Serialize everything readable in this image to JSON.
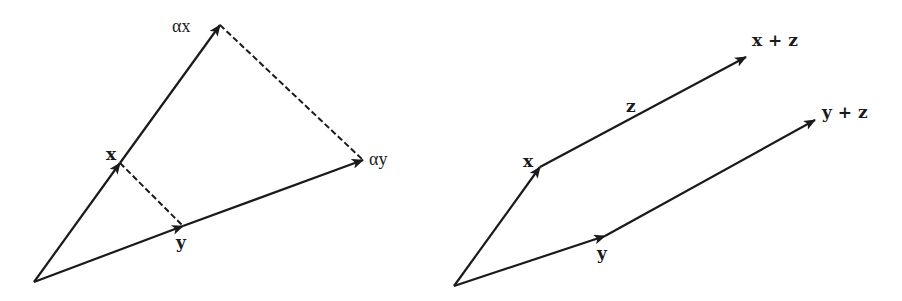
{
  "figure": {
    "panels": [
      {
        "id": "scalar-multiplication",
        "labels": {
          "x": "x",
          "ax": "αx",
          "y": "y",
          "ay": "αy"
        }
      },
      {
        "id": "vector-addition",
        "labels": {
          "x": "x",
          "z": "z",
          "xz": "x + z",
          "y": "y",
          "yz": "y + z"
        }
      }
    ],
    "colors": {
      "ink": "#1a1a1a",
      "background": "#ffffff"
    }
  }
}
